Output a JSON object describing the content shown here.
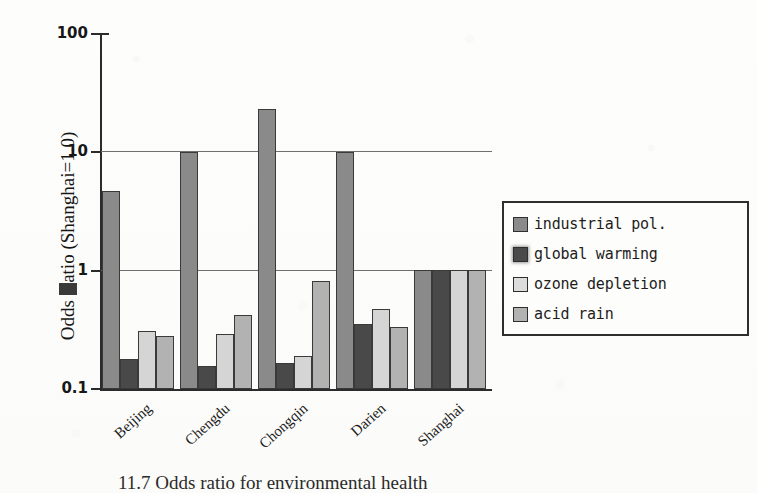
{
  "chart_data": {
    "type": "bar",
    "title": "",
    "xlabel": "",
    "ylabel": "Odds Ratio (Shanghai=1.0)",
    "yscale": "log",
    "ylim": [
      0.1,
      100
    ],
    "ytick_labels": [
      "100",
      "10",
      "1",
      "0.1"
    ],
    "ytick_values": [
      100,
      10,
      1,
      0.1
    ],
    "grid": "horizontal gridlines at 10 and 1",
    "legend_position": "right",
    "categories": [
      "Beijing",
      "Chengdu",
      "Chongqin",
      "Darien",
      "Shanghai"
    ],
    "series": [
      {
        "name": "industrial pol.",
        "color": "#8a8a8a",
        "values": [
          4.7,
          10.0,
          23.0,
          10.0,
          1.0
        ]
      },
      {
        "name": "global warming",
        "color": "#494949",
        "values": [
          0.18,
          0.155,
          0.165,
          0.35,
          1.0
        ]
      },
      {
        "name": "ozone depletion",
        "color": "#d5d5d5",
        "values": [
          0.31,
          0.29,
          0.19,
          0.47,
          1.0
        ]
      },
      {
        "name": "acid rain",
        "color": "#b2b2b2",
        "values": [
          0.28,
          0.42,
          0.82,
          0.33,
          1.0
        ]
      }
    ]
  },
  "axis": {
    "y_title": "Odds Ratio (Shanghai=1.0)",
    "y_title_prefix": "Odds ",
    "y_title_suffix": "atio (Shanghai=1.0)",
    "ticks": [
      {
        "label": "100"
      },
      {
        "label": "10"
      },
      {
        "label": "1"
      },
      {
        "label": "0.1"
      }
    ],
    "categories": [
      {
        "label": "Beijing"
      },
      {
        "label": "Chengdu"
      },
      {
        "label": "Chongqin"
      },
      {
        "label": "Darien"
      },
      {
        "label": "Shanghai"
      }
    ]
  },
  "legend": {
    "items": [
      {
        "label": "industrial pol."
      },
      {
        "label": "global warming"
      },
      {
        "label": "ozone depletion"
      },
      {
        "label": "acid rain"
      }
    ]
  },
  "caption": {
    "text": "11.7  Odds ratio for environmental health"
  }
}
